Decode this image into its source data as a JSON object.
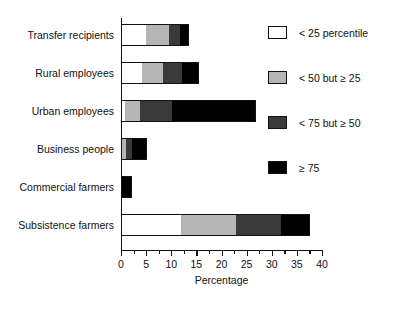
{
  "chart_data": {
    "type": "bar",
    "orientation": "horizontal",
    "stacked": true,
    "title": "",
    "xlabel": "Percentage",
    "ylabel": "",
    "xlim": [
      0,
      40
    ],
    "xticks": [
      0,
      5,
      10,
      15,
      20,
      25,
      30,
      35,
      40
    ],
    "xtick_labels": [
      "0",
      "5",
      "10",
      "15",
      "20",
      "25",
      "30",
      "35",
      "40"
    ],
    "minor_tick_step": 2.5,
    "grid": false,
    "legend_position": "right",
    "categories": [
      "Transfer recipients",
      "Rural employees",
      "Urban employees",
      "Business people",
      "Commercial farmers",
      "Subsistence farmers"
    ],
    "series": [
      {
        "name": "< 25 percentile",
        "color": "#ffffff",
        "values": [
          5.0,
          4.2,
          0.8,
          0.0,
          0.0,
          11.9
        ]
      },
      {
        "name": "< 50 but ≥ 25",
        "color": "#b5b5b5",
        "values": [
          4.6,
          4.2,
          3.0,
          1.0,
          0.0,
          11.0
        ]
      },
      {
        "name": "< 75 but ≥ 50",
        "color": "#3a3a3a",
        "values": [
          2.1,
          3.7,
          6.3,
          1.2,
          0.0,
          8.9
        ]
      },
      {
        "name": "≥ 75",
        "color": "#000000",
        "values": [
          1.9,
          3.5,
          16.8,
          3.0,
          2.2,
          5.8
        ]
      }
    ],
    "totals": [
      13.6,
      15.6,
      26.9,
      5.2,
      2.2,
      37.6
    ]
  },
  "legend": {
    "items": [
      {
        "label": "< 25 percentile",
        "swatch": "q1"
      },
      {
        "label": "< 50 but ≥ 25",
        "swatch": "q2"
      },
      {
        "label": "< 75 but ≥ 50",
        "swatch": "q3"
      },
      {
        "label": "≥ 75",
        "swatch": "q4"
      }
    ]
  },
  "axis": {
    "x_title": "Percentage"
  }
}
